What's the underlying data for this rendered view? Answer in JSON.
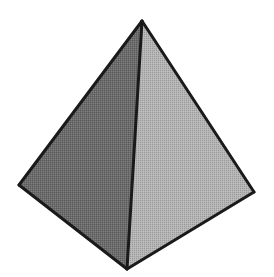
{
  "scene": {
    "name": "tetrahedron-figure",
    "width": 274,
    "height": 277,
    "background_color": "#ffffff",
    "description": "Grayscale shaded triangular pyramid (tetrahedron) on a plain white background"
  },
  "shape": {
    "type": "tetrahedron",
    "outline_color": "#1a1a1a",
    "outline_width": 3,
    "vertices": {
      "apex": {
        "name": "apex-vertex",
        "x": 142,
        "y": 21
      },
      "left": {
        "name": "left-base-vertex",
        "x": 19,
        "y": 185
      },
      "right": {
        "name": "right-base-vertex",
        "x": 254,
        "y": 192
      },
      "front": {
        "name": "front-base-vertex",
        "x": 127,
        "y": 269
      }
    },
    "faces": [
      {
        "name": "left-face",
        "label": "Left face",
        "fill_color": "#6a6a6a",
        "points": "142,21 19,185 127,269"
      },
      {
        "name": "right-face",
        "label": "Right face",
        "fill_color": "#b4b4b4",
        "points": "142,21 254,192 127,269"
      }
    ],
    "edges": [
      {
        "name": "edge-apex-left",
        "label": "Apex to left base vertex",
        "x1": 142,
        "y1": 21,
        "x2": 19,
        "y2": 185
      },
      {
        "name": "edge-apex-right",
        "label": "Apex to right base vertex",
        "x1": 142,
        "y1": 21,
        "x2": 254,
        "y2": 192
      },
      {
        "name": "edge-apex-front",
        "label": "Apex to front base vertex",
        "x1": 142,
        "y1": 21,
        "x2": 127,
        "y2": 269
      },
      {
        "name": "edge-left-front",
        "label": "Left base to front base",
        "x1": 19,
        "y1": 185,
        "x2": 127,
        "y2": 269
      },
      {
        "name": "edge-right-front",
        "label": "Right base to front base",
        "x1": 254,
        "y1": 192,
        "x2": 127,
        "y2": 269
      }
    ]
  },
  "texture": {
    "name": "halftone-dither",
    "enabled": true,
    "opacity": 0.14,
    "cell_size": 2
  }
}
